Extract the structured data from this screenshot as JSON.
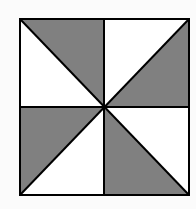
{
  "diagram": {
    "type": "pinwheel-square",
    "square": {
      "x1": 20,
      "y1": 19,
      "x2": 189,
      "y2": 195
    },
    "center": {
      "x": 104,
      "y": 107
    },
    "colors": {
      "background": "#fbfbfb",
      "shaded": "#808080",
      "unshaded": "#ffffff",
      "stroke": "#000000"
    },
    "shaded_triangles": [
      {
        "quadrant": "top-left",
        "points": "20,19 104,19 104,107"
      },
      {
        "quadrant": "top-right",
        "points": "189,19 189,107 104,107"
      },
      {
        "quadrant": "bottom-left",
        "points": "20,107 104,107 20,195"
      },
      {
        "quadrant": "bottom-right",
        "points": "104,107 104,195 189,195"
      }
    ],
    "unshaded_triangles": [
      {
        "quadrant": "top-left",
        "points": "20,19 104,107 20,107"
      },
      {
        "quadrant": "top-right",
        "points": "104,19 189,19 104,107"
      },
      {
        "quadrant": "bottom-left",
        "points": "104,107 104,195 20,195"
      },
      {
        "quadrant": "bottom-right",
        "points": "104,107 189,107 189,195"
      }
    ]
  }
}
